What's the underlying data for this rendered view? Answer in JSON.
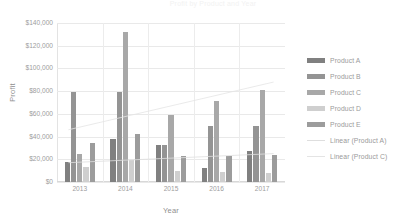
{
  "chart_data": {
    "type": "bar",
    "title": "Profit by Product and Year",
    "xlabel": "Year",
    "ylabel": "Profit",
    "categories": [
      "2013",
      "2014",
      "2015",
      "2016",
      "2017"
    ],
    "ylim": [
      0,
      140000
    ],
    "ytick_labels": [
      "$140,000",
      "$120,000",
      "$100,000",
      "$80,000",
      "$60,000",
      "$40,000",
      "$20,000",
      "$0"
    ],
    "ytick_values": [
      140000,
      120000,
      100000,
      80000,
      60000,
      40000,
      20000,
      0
    ],
    "ytick_step": 20000,
    "grid": true,
    "legend_position": "right",
    "series": [
      {
        "name": "Product A",
        "color": "#808080",
        "values": [
          18000,
          38000,
          33000,
          12000,
          27000
        ]
      },
      {
        "name": "Product B",
        "color": "#949494",
        "values": [
          79000,
          79000,
          33000,
          49000,
          49000
        ]
      },
      {
        "name": "Product C",
        "color": "#a8a8a8",
        "values": [
          25000,
          132000,
          59000,
          71000,
          81000
        ]
      },
      {
        "name": "Product D",
        "color": "#cfcfcf",
        "values": [
          13000,
          19000,
          10000,
          9000,
          8000
        ]
      },
      {
        "name": "Product E",
        "color": "#9c9c9c",
        "values": [
          34000,
          42000,
          23000,
          23000,
          24000
        ]
      }
    ],
    "trendlines": [
      {
        "name": "Linear (Product A)",
        "color": "#dedede",
        "start_value": 17000,
        "end_value": 25000
      },
      {
        "name": "Linear (Product C)",
        "color": "#e4e4e4",
        "start_value": 46000,
        "end_value": 88000
      }
    ]
  },
  "legend": {
    "items": [
      {
        "label": "Product A",
        "type": "swatch"
      },
      {
        "label": "Product B",
        "type": "swatch"
      },
      {
        "label": "Product C",
        "type": "swatch"
      },
      {
        "label": "Product D",
        "type": "swatch"
      },
      {
        "label": "Product E",
        "type": "swatch"
      },
      {
        "label": "Linear  (Product A)",
        "type": "line"
      },
      {
        "label": "Linear  (Product C)",
        "type": "line"
      }
    ]
  }
}
